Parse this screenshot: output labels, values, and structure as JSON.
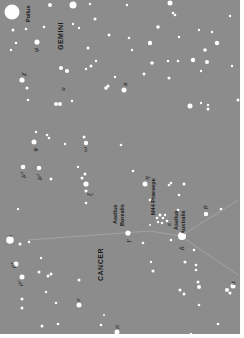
{
  "map": {
    "background": "#8c8c8c",
    "star_color": "#ffffff",
    "line_color": "#b5b5b5",
    "constellations": [
      {
        "name": "GEMINI"
      },
      {
        "name": "CANCER"
      }
    ],
    "labels": {
      "pollux": "Pollux",
      "gemini": "GEMINI",
      "cancer": "CANCER",
      "asellus_borealis": [
        "Asellus",
        "Borealis"
      ],
      "asellus_australis": [
        "Asellus",
        "Australis"
      ],
      "m44": "M44 Praesepe",
      "phi": "φ",
      "chi": "χ",
      "psi": "ψ",
      "omega": "ω",
      "mu1": "μ¹",
      "mu2": "μ²",
      "iota": "ι",
      "rho1": "ρ¹",
      "rho2": "ρ²",
      "eta": "η",
      "gamma": "γ",
      "delta": "δ",
      "theta": "θ",
      "epsilon": "ε",
      "nu": "ν",
      "alpha": "α",
      "xi": "ξ",
      "pi": "π",
      "kappa": "κ",
      "upsilon": "υ"
    }
  }
}
